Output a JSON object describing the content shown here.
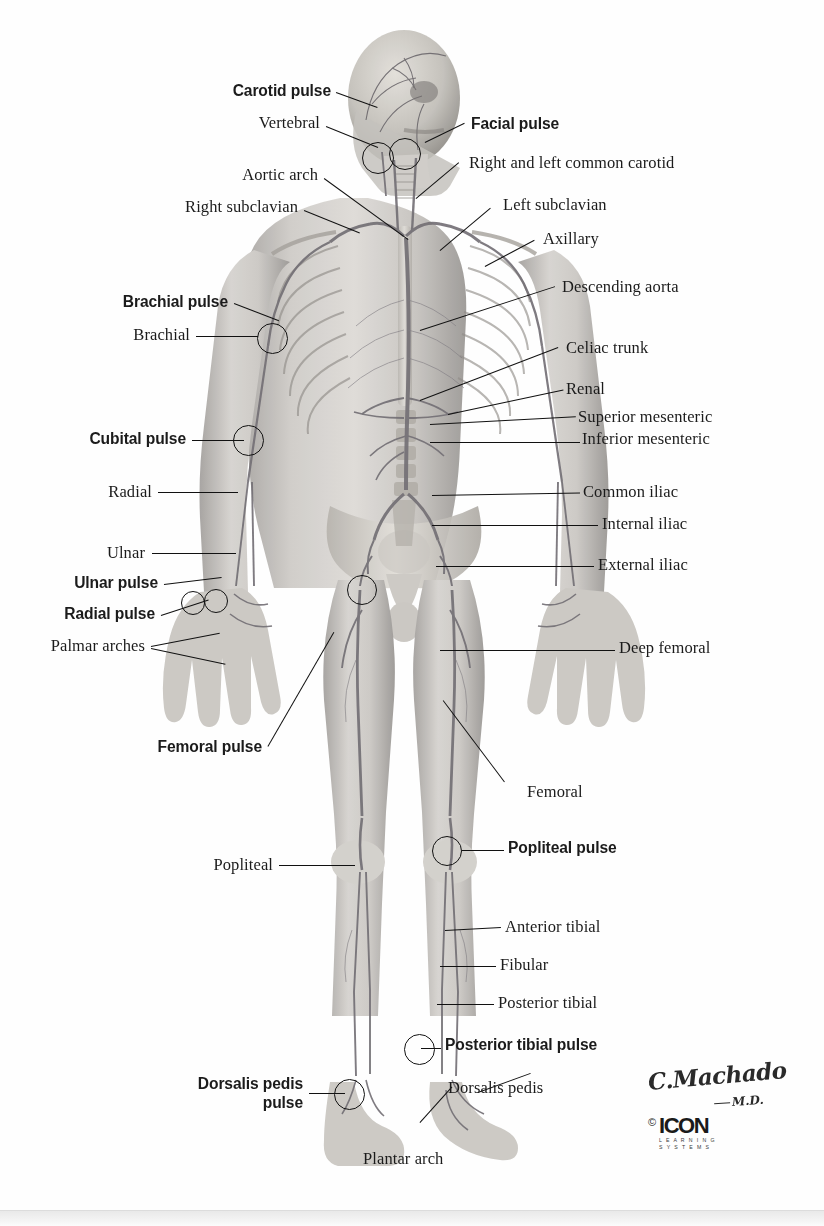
{
  "figure": {
    "colors": {
      "background": "#fefefe",
      "line": "#111111",
      "label_text": "#1b1b1b",
      "artery": "#6e6a72",
      "bone": "#b9b5b0",
      "skin": "#c9c6c2"
    }
  },
  "labels_left": [
    {
      "id": "carotid-pulse",
      "text": "Carotid pulse",
      "bold": true,
      "x": 331,
      "y": 89
    },
    {
      "id": "vertebral",
      "text": "Vertebral",
      "bold": false,
      "x": 320,
      "y": 120
    },
    {
      "id": "aortic-arch",
      "text": "Aortic arch",
      "bold": false,
      "x": 318,
      "y": 172
    },
    {
      "id": "right-subclavian",
      "text": "Right subclavian",
      "bold": false,
      "x": 298,
      "y": 204
    },
    {
      "id": "brachial-pulse",
      "text": "Brachial pulse",
      "bold": true,
      "x": 228,
      "y": 300
    },
    {
      "id": "brachial",
      "text": "Brachial",
      "bold": false,
      "x": 190,
      "y": 332
    },
    {
      "id": "cubital-pulse",
      "text": "Cubital pulse",
      "bold": true,
      "x": 186,
      "y": 437
    },
    {
      "id": "radial",
      "text": "Radial",
      "bold": false,
      "x": 152,
      "y": 489
    },
    {
      "id": "ulnar",
      "text": "Ulnar",
      "bold": false,
      "x": 145,
      "y": 550
    },
    {
      "id": "ulnar-pulse",
      "text": "Ulnar pulse",
      "bold": true,
      "x": 158,
      "y": 581
    },
    {
      "id": "radial-pulse",
      "text": "Radial pulse",
      "bold": true,
      "x": 155,
      "y": 612
    },
    {
      "id": "palmar-arches",
      "text": "Palmar arches",
      "bold": false,
      "x": 145,
      "y": 643
    },
    {
      "id": "femoral-pulse",
      "text": "Femoral pulse",
      "bold": true,
      "x": 262,
      "y": 745
    },
    {
      "id": "popliteal",
      "text": "Popliteal",
      "bold": false,
      "x": 273,
      "y": 862
    }
  ],
  "labels_left_multiline": [
    {
      "id": "dorsalis-pedis-pulse",
      "line1": "Dorsalis pedis",
      "line2": "pulse",
      "bold": true,
      "x": 303,
      "y": 1077
    }
  ],
  "labels_right": [
    {
      "id": "facial-pulse",
      "text": "Facial pulse",
      "bold": true,
      "x": 471,
      "y": 122
    },
    {
      "id": "right-and-left-common-carotid",
      "text": "Right and left common carotid",
      "bold": false,
      "x": 469,
      "y": 160
    },
    {
      "id": "left-subclavian",
      "text": "Left subclavian",
      "bold": false,
      "x": 503,
      "y": 202
    },
    {
      "id": "axillary",
      "text": "Axillary",
      "bold": false,
      "x": 543,
      "y": 236
    },
    {
      "id": "descending-aorta",
      "text": "Descending aorta",
      "bold": false,
      "x": 562,
      "y": 284
    },
    {
      "id": "celiac-trunk",
      "text": "Celiac trunk",
      "bold": false,
      "x": 566,
      "y": 345
    },
    {
      "id": "renal",
      "text": "Renal",
      "bold": false,
      "x": 566,
      "y": 386
    },
    {
      "id": "superior-mesenteric",
      "text": "Superior mesenteric",
      "bold": false,
      "x": 578,
      "y": 414
    },
    {
      "id": "inferior-mesenteric",
      "text": "Inferior mesenteric",
      "bold": false,
      "x": 582,
      "y": 436
    },
    {
      "id": "common-iliac",
      "text": "Common iliac",
      "bold": false,
      "x": 583,
      "y": 489
    },
    {
      "id": "internal-iliac",
      "text": "Internal iliac",
      "bold": false,
      "x": 602,
      "y": 521
    },
    {
      "id": "external-iliac",
      "text": "External iliac",
      "bold": false,
      "x": 598,
      "y": 562
    },
    {
      "id": "deep-femoral",
      "text": "Deep femoral",
      "bold": false,
      "x": 619,
      "y": 645
    },
    {
      "id": "femoral",
      "text": "Femoral",
      "bold": false,
      "x": 527,
      "y": 789
    },
    {
      "id": "popliteal-pulse",
      "text": "Popliteal pulse",
      "bold": true,
      "x": 508,
      "y": 846
    },
    {
      "id": "anterior-tibial",
      "text": "Anterior tibial",
      "bold": false,
      "x": 505,
      "y": 924
    },
    {
      "id": "fibular",
      "text": "Fibular",
      "bold": false,
      "x": 500,
      "y": 962
    },
    {
      "id": "posterior-tibial",
      "text": "Posterior tibial",
      "bold": false,
      "x": 498,
      "y": 1000
    },
    {
      "id": "posterior-tibial-pulse",
      "text": "Posterior tibial pulse",
      "bold": true,
      "x": 445,
      "y": 1043
    },
    {
      "id": "dorsalis-pedis",
      "text": "Dorsalis pedis",
      "bold": false,
      "x": 448,
      "y": 1085
    },
    {
      "id": "plantar-arch",
      "text": "Plantar arch",
      "bold": false,
      "x": 363,
      "y": 1156
    }
  ],
  "signature": {
    "name": "C.Machado",
    "credential": "M.D.",
    "copyright_symbol": "©",
    "brand": "ICON",
    "brand_sub_line1": "L E A R N I N G",
    "brand_sub_line2": "S Y S T E M S"
  }
}
